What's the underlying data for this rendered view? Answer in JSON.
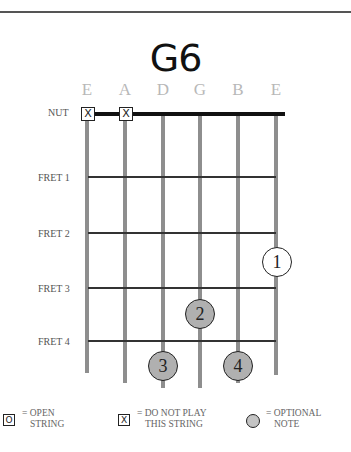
{
  "chord": {
    "name": "G6",
    "strings": [
      {
        "name": "E",
        "x": 87,
        "bottom": 373
      },
      {
        "name": "A",
        "x": 125,
        "bottom": 383
      },
      {
        "name": "D",
        "x": 163,
        "bottom": 388
      },
      {
        "name": "G",
        "x": 200,
        "bottom": 388
      },
      {
        "name": "B",
        "x": 238,
        "bottom": 383
      },
      {
        "name": "E",
        "x": 276,
        "bottom": 375
      }
    ],
    "nut_label": "NUT",
    "frets": [
      {
        "label": "FRET 1",
        "y": 177
      },
      {
        "label": "FRET 2",
        "y": 233
      },
      {
        "label": "FRET 3",
        "y": 288
      },
      {
        "label": "FRET 4",
        "y": 341
      }
    ],
    "muted": [
      {
        "string": "E",
        "symbol": "X"
      },
      {
        "string": "A",
        "symbol": "X"
      }
    ],
    "fingers": [
      {
        "number": "1",
        "string": "E (high)",
        "fret": 2,
        "style": "open"
      },
      {
        "number": "2",
        "string": "G",
        "fret": 3,
        "style": "optional"
      },
      {
        "number": "3",
        "string": "D",
        "fret": 4,
        "style": "optional"
      },
      {
        "number": "4",
        "string": "B",
        "fret": 4,
        "style": "optional"
      }
    ]
  },
  "legend": {
    "open_symbol": "O",
    "open_text_1": "= OPEN",
    "open_text_2": "STRING",
    "mute_symbol": "X",
    "mute_text_1": "= DO NOT PLAY",
    "mute_text_2": "THIS STRING",
    "optional_text_1": "= OPTIONAL",
    "optional_text_2": "NOTE"
  },
  "colors": {
    "string": "#8e8e8e",
    "optional_fill": "#b0b0b0",
    "string_label": "#b8b8b8"
  }
}
